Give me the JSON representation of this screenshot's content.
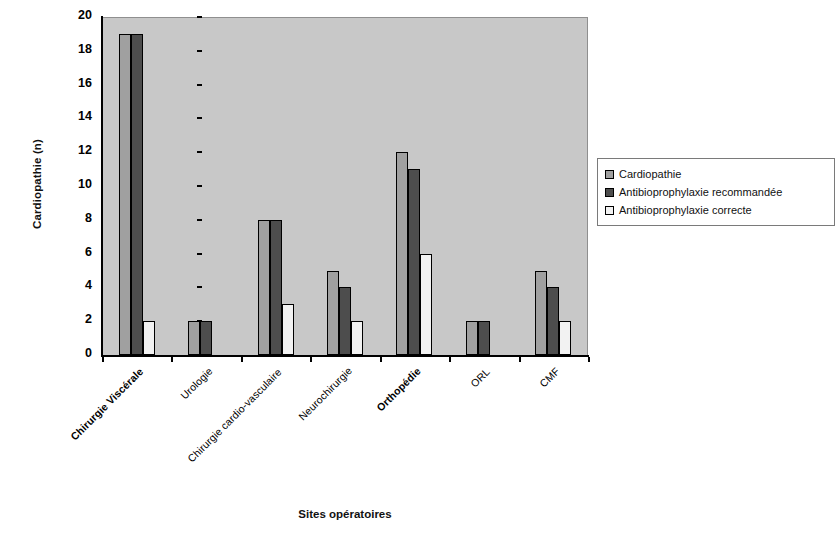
{
  "chart_data": {
    "type": "bar",
    "title": "",
    "xlabel": "Sites opératoires",
    "ylabel": "Cardiopathie (n)",
    "ylim": [
      0,
      20
    ],
    "yticks": [
      0,
      2,
      4,
      6,
      8,
      10,
      12,
      14,
      16,
      18,
      20
    ],
    "grid": false,
    "legend_position": "right",
    "plot_background": "#c8c8c8",
    "categories": [
      "Chirurgie Viscérale",
      "Urologie",
      "Chirurgie cardio-vasculaire",
      "Neurochirurgie",
      "Orthopédie",
      "ORL",
      "CMF"
    ],
    "categories_bold": [
      true,
      false,
      false,
      false,
      true,
      false,
      false
    ],
    "series": [
      {
        "name": "Cardiopathie",
        "color": "#a0a0a0",
        "values": [
          19,
          2,
          8,
          5,
          12,
          2,
          5
        ]
      },
      {
        "name": "Antibioprophylaxie recommandée",
        "color": "#4d4d4d",
        "values": [
          19,
          2,
          8,
          4,
          11,
          2,
          4
        ]
      },
      {
        "name": "Antibioprophylaxie correcte",
        "color": "#f2f2f2",
        "values": [
          2,
          0,
          3,
          2,
          6,
          0,
          2
        ]
      }
    ]
  },
  "axes": {
    "y_title": "Cardiopathie (n)",
    "x_title": "Sites opératoires",
    "y_tick_labels": [
      "0",
      "2",
      "4",
      "6",
      "8",
      "10",
      "12",
      "14",
      "16",
      "18",
      "20"
    ]
  },
  "legend": {
    "entries": [
      {
        "label": "Cardiopathie",
        "swatch": "#a0a0a0"
      },
      {
        "label": "Antibioprophylaxie recommandée",
        "swatch": "#4d4d4d"
      },
      {
        "label": "Antibioprophylaxie correcte",
        "swatch": "#f2f2f2"
      }
    ]
  }
}
